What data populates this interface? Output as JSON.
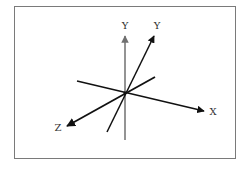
{
  "diagram": {
    "title": "",
    "type": "3D coordinate axes",
    "labels": {
      "y_vertical": "Y",
      "y_tilted": "Y",
      "x": "X",
      "z": "Z"
    },
    "colors": {
      "frame": "#7a7a7a",
      "axis_dark": "#111111",
      "axis_gray": "#707070",
      "label": "#333333",
      "background": "#ffffff"
    },
    "axes": [
      {
        "name": "Y (vertical)",
        "from": [
          125,
          140
        ],
        "to": [
          125,
          34
        ],
        "color": "gray"
      },
      {
        "name": "Y (tilted)",
        "from": [
          107,
          132
        ],
        "to": [
          155,
          34
        ],
        "color": "dark"
      },
      {
        "name": "X",
        "from": [
          77,
          81
        ],
        "to": [
          205,
          111
        ],
        "color": "dark"
      },
      {
        "name": "Z",
        "from": [
          155,
          77
        ],
        "to": [
          66,
          127
        ],
        "color": "dark"
      }
    ],
    "origin": [
      125,
      93
    ]
  }
}
